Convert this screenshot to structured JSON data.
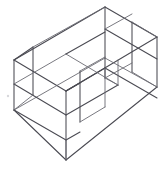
{
  "figure": {
    "title": "Isometric wireframe line drawing",
    "view": "isometric",
    "canvas": {
      "width": 165,
      "height": 169,
      "background": "#ffffff"
    },
    "stroke": {
      "color": "#4a4a52",
      "secondary_color": "#6a6a72",
      "width": 1.05
    },
    "labels": [],
    "annotations": [],
    "geometry": {
      "outer_box": {
        "name": "outer-shell",
        "vertices": {
          "top_back": [
            105,
            7
          ],
          "top_left": [
            14,
            60
          ],
          "top_right": [
            157,
            37
          ],
          "top_front": [
            66,
            91
          ],
          "bot_left": [
            14,
            110
          ],
          "bot_right": [
            157,
            87
          ],
          "bot_front": [
            66,
            160
          ]
        }
      },
      "inner_divider": {
        "name": "inner-divider-panel",
        "vertices": {
          "a": [
            105,
            78
          ],
          "b": [
            33,
            47
          ],
          "c": [
            33,
            95
          ],
          "d": [
            80,
            71
          ],
          "e": [
            80,
            122
          ]
        }
      },
      "shelf": {
        "name": "mid-shelf",
        "vertices": {
          "left": [
            14,
            84
          ],
          "front": [
            66,
            115
          ],
          "right": [
            118,
            85
          ]
        }
      }
    }
  }
}
